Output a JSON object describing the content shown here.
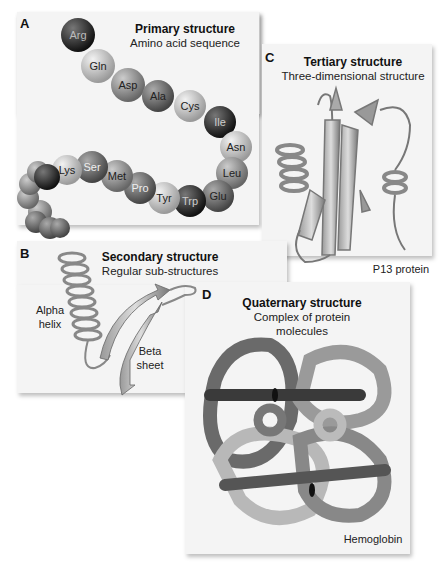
{
  "panels": {
    "A": {
      "letter": "A",
      "title": "Primary structure",
      "subtitle": "Amino acid sequence",
      "amino_acids": [
        "Arg",
        "Gln",
        "Asp",
        "Ala",
        "Cys",
        "Ile",
        "Asn",
        "Leu",
        "Glu",
        "Trp",
        "Tyr",
        "Pro",
        "Met",
        "Ser",
        "Lys"
      ]
    },
    "B": {
      "letter": "B",
      "title": "Secondary structure",
      "subtitle": "Regular sub-structures",
      "label_alpha": "Alpha helix",
      "label_alpha_1": "Alpha",
      "label_alpha_2": "helix",
      "label_beta_1": "Beta",
      "label_beta_2": "sheet"
    },
    "C": {
      "letter": "C",
      "title": "Tertiary structure",
      "subtitle": "Three-dimensional structure",
      "caption": "P13 protein"
    },
    "D": {
      "letter": "D",
      "title": "Quaternary structure",
      "subtitle_1": "Complex of protein",
      "subtitle_2": "molecules",
      "caption": "Hemoglobin"
    }
  },
  "colors": {
    "panel_bg": "#f4f4f4",
    "dark": "#2a2a2a",
    "mid": "#888888",
    "light": "#c8c8c8"
  }
}
